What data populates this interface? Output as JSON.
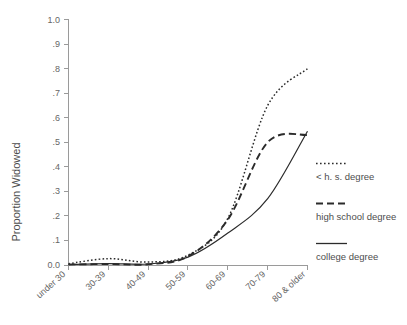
{
  "chart_data": {
    "type": "line",
    "title": "",
    "subtitle": "",
    "xlabel": "",
    "ylabel": "Proportion Widowed",
    "categories": [
      "under 30",
      "30-39",
      "40-49",
      "50-59",
      "60-69",
      "70-79",
      "80 & older"
    ],
    "ylim": [
      0.0,
      1.0
    ],
    "ytick_labels": [
      "0.0",
      ".1",
      ".2",
      ".3",
      ".4",
      ".5",
      ".6",
      ".7",
      ".8",
      ".9",
      "1.0"
    ],
    "ytick_values": [
      0.0,
      0.1,
      0.2,
      0.3,
      0.4,
      0.5,
      0.6,
      0.7,
      0.8,
      0.9,
      1.0
    ],
    "grid": false,
    "legend_position": "right",
    "series": [
      {
        "name": "< h. s. degree",
        "style": "dotted",
        "values": [
          0.005,
          0.026,
          0.012,
          0.04,
          0.19,
          0.65,
          0.8
        ]
      },
      {
        "name": "high school degree",
        "style": "dashed",
        "values": [
          0.002,
          0.004,
          0.003,
          0.035,
          0.185,
          0.5,
          0.53
        ]
      },
      {
        "name": "college degree",
        "style": "solid",
        "values": [
          0.002,
          0.006,
          0.004,
          0.032,
          0.13,
          0.27,
          0.545
        ]
      }
    ]
  },
  "legend": {
    "items": [
      {
        "label": "< h. s. degree",
        "style": "dotted"
      },
      {
        "label": "high school degree",
        "style": "dashed"
      },
      {
        "label": "college degree",
        "style": "solid"
      }
    ]
  },
  "axes": {
    "y_title": "Proportion Widowed"
  }
}
